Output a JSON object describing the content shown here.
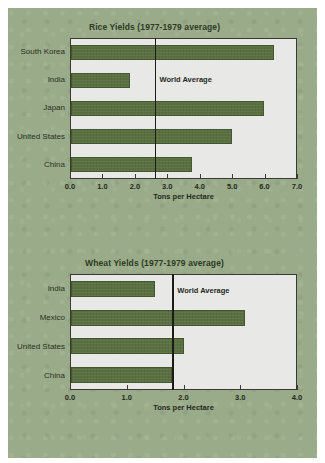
{
  "theme": {
    "page_background": "#ffffff",
    "paper_background": "#9aab89",
    "plot_background": "#e8e8e6",
    "bar_color": "#5a7040",
    "bar_border_color": "#44562f",
    "axis_color": "#3a3a34",
    "text_color": "#24291c",
    "average_line_color": "#1d1d18"
  },
  "chart_data": [
    {
      "type": "bar",
      "orientation": "horizontal",
      "title": "Rice Yields (1977-1979 average)",
      "xlabel": "Tons per Hectare",
      "ylabel": "",
      "categories": [
        "South Korea",
        "India",
        "Japan",
        "United States",
        "China"
      ],
      "values": [
        6.3,
        1.85,
        6.0,
        5.0,
        3.75
      ],
      "xlim": [
        0.0,
        7.0
      ],
      "xticks": [
        0.0,
        1.0,
        2.0,
        3.0,
        4.0,
        5.0,
        6.0,
        7.0
      ],
      "xticklabels": [
        "0.0",
        "1.0",
        "2.0",
        "3.0",
        "4.0",
        "5.0",
        "6.0",
        "7.0"
      ],
      "grid": false,
      "legend": "none",
      "annotations": [
        {
          "label": "World Average",
          "type": "vline",
          "value": 2.6
        }
      ]
    },
    {
      "type": "bar",
      "orientation": "horizontal",
      "title": "Wheat Yields (1977-1979 average)",
      "xlabel": "Tons per Hectare",
      "ylabel": "",
      "categories": [
        "India",
        "Mexico",
        "United States",
        "China"
      ],
      "values": [
        1.5,
        3.1,
        2.0,
        1.8
      ],
      "xlim": [
        0.0,
        4.0
      ],
      "xticks": [
        0.0,
        1.0,
        2.0,
        3.0,
        4.0
      ],
      "xticklabels": [
        "0.0",
        "1.0",
        "2.0",
        "3.0",
        "4.0"
      ],
      "grid": false,
      "legend": "none",
      "annotations": [
        {
          "label": "World Average",
          "type": "vline",
          "value": 1.8
        }
      ]
    }
  ]
}
